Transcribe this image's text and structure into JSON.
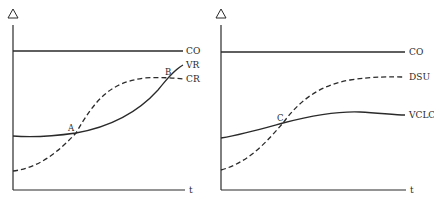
{
  "diagram": {
    "panels": [
      {
        "id": "left",
        "y_axis_symbol": "Δ",
        "x_axis_label": "t",
        "curves": [
          {
            "label": "CO",
            "style": "solid",
            "shape": "flat horizontal line"
          },
          {
            "label": "VR",
            "style": "solid",
            "shape": "slowly rising then steep rise"
          },
          {
            "label": "CR",
            "style": "dashed",
            "shape": "S-curve rising to plateau"
          }
        ],
        "intersections": [
          {
            "label": "A",
            "between": [
              "VR",
              "CR"
            ]
          },
          {
            "label": "B",
            "between": [
              "VR",
              "CR"
            ]
          }
        ],
        "labels": {
          "co": "CO",
          "vr": "VR",
          "cr": "CR",
          "a": "A",
          "b": "B",
          "t": "t"
        }
      },
      {
        "id": "right",
        "y_axis_symbol": "Δ",
        "x_axis_label": "t",
        "curves": [
          {
            "label": "CO",
            "style": "solid",
            "shape": "flat horizontal line"
          },
          {
            "label": "DSU",
            "style": "dashed",
            "shape": "S-curve rising to plateau"
          },
          {
            "label": "VCLC",
            "style": "solid",
            "shape": "gentle rise to low plateau"
          }
        ],
        "intersections": [
          {
            "label": "C",
            "between": [
              "VCLC",
              "DSU"
            ]
          }
        ],
        "labels": {
          "co": "CO",
          "dsu": "DSU",
          "vclc": "VCLC",
          "c": "C",
          "t": "t"
        }
      }
    ]
  }
}
